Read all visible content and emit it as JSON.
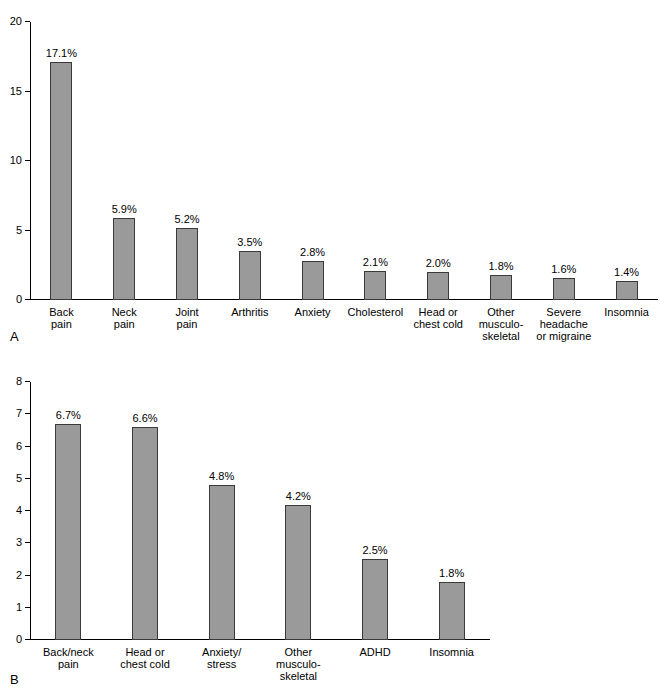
{
  "chart_data": [
    {
      "type": "bar",
      "panel": "A",
      "title": "",
      "xlabel": "",
      "ylabel": "",
      "ylim": [
        0,
        20
      ],
      "yticks": [
        0,
        5,
        10,
        15,
        20
      ],
      "grid": false,
      "categories": [
        "Back\npain",
        "Neck\npain",
        "Joint\npain",
        "Arthritis",
        "Anxiety",
        "Cholesterol",
        "Head or\nchest cold",
        "Other\nmusculo-\nskeletal",
        "Severe\nheadache\nor migraine",
        "Insomnia"
      ],
      "values": [
        17.1,
        5.9,
        5.2,
        3.5,
        2.8,
        2.1,
        2.0,
        1.8,
        1.6,
        1.4
      ],
      "data_labels": [
        "17.1%",
        "5.9%",
        "5.2%",
        "3.5%",
        "2.8%",
        "2.1%",
        "2.0%",
        "1.8%",
        "1.6%",
        "1.4%"
      ]
    },
    {
      "type": "bar",
      "panel": "B",
      "title": "",
      "xlabel": "",
      "ylabel": "",
      "ylim": [
        0,
        8
      ],
      "yticks": [
        0,
        1,
        2,
        3,
        4,
        5,
        6,
        7,
        8
      ],
      "grid": false,
      "categories": [
        "Back/neck\npain",
        "Head or\nchest cold",
        "Anxiety/\nstress",
        "Other\nmusculo-\nskeletal",
        "ADHD",
        "Insomnia"
      ],
      "values": [
        6.7,
        6.6,
        4.8,
        4.2,
        2.5,
        1.8
      ],
      "data_labels": [
        "6.7%",
        "6.6%",
        "4.8%",
        "4.2%",
        "2.5%",
        "1.8%"
      ]
    }
  ],
  "panels": {
    "a": {
      "letter": "A",
      "ytick_labels": [
        "0",
        "5",
        "10",
        "15",
        "20"
      ],
      "bars": [
        {
          "label": "17.1%",
          "cat_lines": [
            "Back",
            "pain"
          ]
        },
        {
          "label": "5.9%",
          "cat_lines": [
            "Neck",
            "pain"
          ]
        },
        {
          "label": "5.2%",
          "cat_lines": [
            "Joint",
            "pain"
          ]
        },
        {
          "label": "3.5%",
          "cat_lines": [
            "Arthritis"
          ]
        },
        {
          "label": "2.8%",
          "cat_lines": [
            "Anxiety"
          ]
        },
        {
          "label": "2.1%",
          "cat_lines": [
            "Cholesterol"
          ]
        },
        {
          "label": "2.0%",
          "cat_lines": [
            "Head or",
            "chest cold"
          ]
        },
        {
          "label": "1.8%",
          "cat_lines": [
            "Other",
            "musculo-",
            "skeletal"
          ]
        },
        {
          "label": "1.6%",
          "cat_lines": [
            "Severe",
            "headache",
            "or migraine"
          ]
        },
        {
          "label": "1.4%",
          "cat_lines": [
            "Insomnia"
          ]
        }
      ]
    },
    "b": {
      "letter": "B",
      "ytick_labels": [
        "0",
        "1",
        "2",
        "3",
        "4",
        "5",
        "6",
        "7",
        "8"
      ],
      "bars": [
        {
          "label": "6.7%",
          "cat_lines": [
            "Back/neck",
            "pain"
          ]
        },
        {
          "label": "6.6%",
          "cat_lines": [
            "Head or",
            "chest cold"
          ]
        },
        {
          "label": "4.8%",
          "cat_lines": [
            "Anxiety/",
            "stress"
          ]
        },
        {
          "label": "4.2%",
          "cat_lines": [
            "Other",
            "musculo-",
            "skeletal"
          ]
        },
        {
          "label": "2.5%",
          "cat_lines": [
            "ADHD"
          ]
        },
        {
          "label": "1.8%",
          "cat_lines": [
            "Insomnia"
          ]
        }
      ]
    }
  },
  "colors": {
    "bar_fill": "#9a9a9a",
    "bar_stroke": "#3a3a3a",
    "axis": "#000000",
    "background": "#ffffff"
  }
}
